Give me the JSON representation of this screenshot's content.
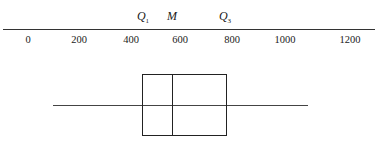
{
  "chart_data": {
    "type": "boxplot",
    "title": "",
    "xlabel": "",
    "ylabel": "",
    "axis": {
      "position": "top",
      "min": 0,
      "max": 1200,
      "ticks": [
        0,
        200,
        400,
        600,
        800,
        1000,
        1200
      ],
      "tick_labels": [
        "0",
        "200",
        "400",
        "600",
        "800",
        "1000",
        "1200"
      ],
      "grid": false
    },
    "annotations": [
      {
        "label": "Q",
        "sub": "1",
        "value": 443
      },
      {
        "label": "M",
        "sub": "",
        "value": 559
      },
      {
        "label": "Q",
        "sub": "3",
        "value": 773
      }
    ],
    "five_number_summary": {
      "min": 97,
      "q1": 443,
      "median": 559,
      "q3": 773,
      "max": 1087
    },
    "orientation": "horizontal"
  },
  "layout": {
    "px_per_unit": 0.2575,
    "x_zero_px": 28,
    "box_top_px": 74,
    "box_bottom_px": 136,
    "whisker_y_px": 105
  }
}
